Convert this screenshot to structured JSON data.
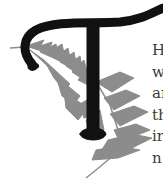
{
  "dropcap": {
    "letter": "T",
    "letter_color": "#111111",
    "ornament": "fern-icon",
    "ornament_color": "#8c8c8c"
  },
  "body_text": {
    "lines": [
      "H",
      "w",
      "ar",
      "th",
      "ir",
      "n"
    ]
  }
}
